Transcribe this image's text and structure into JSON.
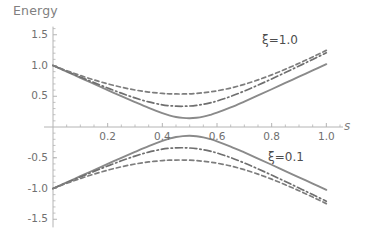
{
  "chart_data": {
    "type": "line",
    "title": "",
    "xlabel": "s",
    "ylabel": "Energy",
    "xlim": [
      0.0,
      1.05
    ],
    "ylim": [
      -1.6,
      1.6
    ],
    "grid": false,
    "legend_position": "inline-annotations",
    "xticks": [
      0.2,
      0.4,
      0.6,
      0.8,
      1.0
    ],
    "xtick_labels": [
      "0.2",
      "0.4",
      "0.6",
      "0.8",
      "1.0"
    ],
    "yticks": [
      1.5,
      1.0,
      0.5,
      -0.5,
      -1.0,
      -1.5
    ],
    "ytick_labels": [
      "1.5",
      "1.0",
      "0.5",
      "-0.5",
      "-1.0",
      "-1.5"
    ],
    "x": [
      0.0,
      0.05,
      0.1,
      0.15,
      0.2,
      0.25,
      0.3,
      0.35,
      0.4,
      0.425,
      0.45,
      0.475,
      0.5,
      0.525,
      0.55,
      0.575,
      0.6,
      0.65,
      0.7,
      0.75,
      0.8,
      0.85,
      0.9,
      0.95,
      1.0
    ],
    "series": [
      {
        "name": "upper-solid",
        "label": "xi = 0.1 (upper branch)",
        "style": "solid",
        "color": "#8a8a8a",
        "values": [
          1.0,
          0.9,
          0.8,
          0.7,
          0.601,
          0.502,
          0.405,
          0.311,
          0.225,
          0.19,
          0.163,
          0.148,
          0.143,
          0.15,
          0.168,
          0.196,
          0.232,
          0.318,
          0.414,
          0.513,
          0.614,
          0.716,
          0.818,
          0.92,
          1.022
        ]
      },
      {
        "name": "upper-dotdash",
        "label": "intermediate coupling (upper branch)",
        "style": "dashdot",
        "color": "#6f6f6f",
        "values": [
          1.0,
          0.906,
          0.813,
          0.722,
          0.634,
          0.55,
          0.473,
          0.408,
          0.361,
          0.347,
          0.339,
          0.337,
          0.341,
          0.352,
          0.369,
          0.393,
          0.423,
          0.497,
          0.585,
          0.681,
          0.782,
          0.886,
          0.992,
          1.099,
          1.207
        ]
      },
      {
        "name": "upper-dashed",
        "label": "xi = 1.0 (upper branch)",
        "style": "dashed",
        "color": "#7d7d7d",
        "values": [
          1.0,
          0.916,
          0.838,
          0.766,
          0.702,
          0.647,
          0.602,
          0.568,
          0.546,
          0.54,
          0.537,
          0.537,
          0.54,
          0.547,
          0.557,
          0.571,
          0.588,
          0.634,
          0.694,
          0.766,
          0.848,
          0.939,
          1.036,
          1.139,
          1.246
        ]
      },
      {
        "name": "lower-solid",
        "label": "xi = 0.1 (lower branch)",
        "style": "solid",
        "color": "#8a8a8a",
        "values": [
          -1.0,
          -0.9,
          -0.8,
          -0.7,
          -0.601,
          -0.502,
          -0.405,
          -0.311,
          -0.225,
          -0.19,
          -0.163,
          -0.148,
          -0.143,
          -0.15,
          -0.168,
          -0.196,
          -0.232,
          -0.318,
          -0.414,
          -0.513,
          -0.614,
          -0.716,
          -0.818,
          -0.92,
          -1.022
        ]
      },
      {
        "name": "lower-dotdash",
        "label": "intermediate coupling (lower branch)",
        "style": "dashdot",
        "color": "#6f6f6f",
        "values": [
          -1.0,
          -0.906,
          -0.813,
          -0.722,
          -0.634,
          -0.55,
          -0.473,
          -0.408,
          -0.361,
          -0.347,
          -0.339,
          -0.337,
          -0.341,
          -0.352,
          -0.369,
          -0.393,
          -0.423,
          -0.497,
          -0.585,
          -0.681,
          -0.782,
          -0.886,
          -0.992,
          -1.099,
          -1.207
        ]
      },
      {
        "name": "lower-dashed",
        "label": "xi = 1.0 (lower branch)",
        "style": "dashed",
        "color": "#7d7d7d",
        "values": [
          -1.0,
          -0.916,
          -0.838,
          -0.766,
          -0.702,
          -0.647,
          -0.602,
          -0.568,
          -0.546,
          -0.54,
          -0.537,
          -0.537,
          -0.54,
          -0.547,
          -0.557,
          -0.571,
          -0.588,
          -0.634,
          -0.694,
          -0.766,
          -0.848,
          -0.939,
          -1.036,
          -1.139,
          -1.246
        ]
      }
    ],
    "annotations": [
      {
        "name": "xi-high",
        "text": "ξ=1.0",
        "x": 0.78,
        "y": 1.22
      },
      {
        "name": "xi-low",
        "text": "ξ=0.1",
        "x": 0.8,
        "y": -0.42
      }
    ]
  },
  "labels": {
    "y_axis_title": "Energy",
    "x_axis_title": "s",
    "xi_high": "ξ=1.0",
    "xi_low": "ξ=0.1"
  },
  "colors": {
    "axis": "#b4b4b4",
    "text": "#707070",
    "solid_curve": "#8a8a8a",
    "dashdot_curve": "#6f6f6f",
    "dashed_curve": "#7d7d7d",
    "background": "#ffffff"
  }
}
